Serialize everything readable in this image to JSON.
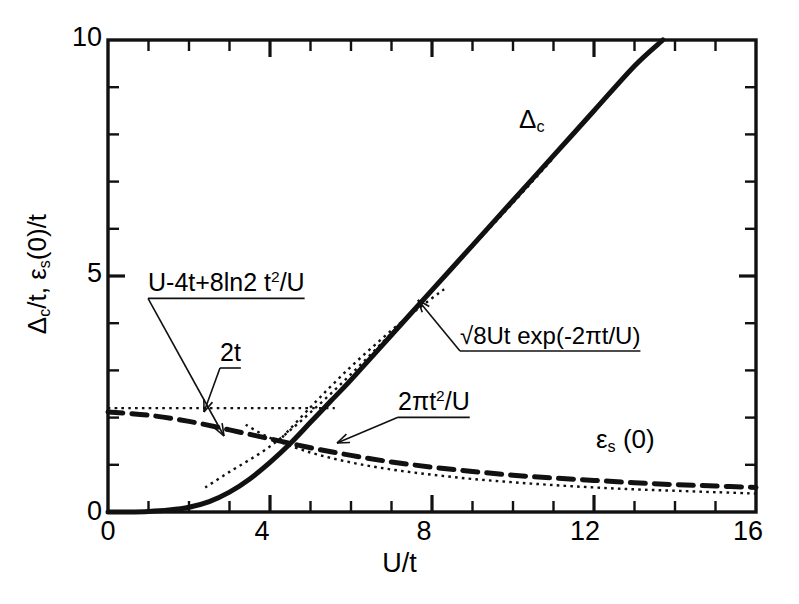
{
  "page": {
    "header_faint": "",
    "page_number": ""
  },
  "chart_data": {
    "type": "line",
    "title": "",
    "xlabel": "U/t",
    "ylabel": "Δc/t, εs(0)/t",
    "xlim": [
      0,
      16
    ],
    "ylim": [
      0,
      10
    ],
    "grid": false,
    "legend": "inline-annotations",
    "x_ticks_major": [
      0,
      4,
      8,
      12,
      16
    ],
    "x_ticks_major_labels": [
      "0",
      "4",
      "8",
      "12",
      "16"
    ],
    "x_tick_minor_step": 1,
    "y_ticks_major": [
      0,
      5,
      10
    ],
    "y_ticks_major_labels": [
      "0",
      "5",
      "10"
    ],
    "y_tick_minor_step": 1,
    "series": [
      {
        "name": "Δc",
        "style": "solid",
        "label": "Δc",
        "x": [
          0,
          0.5,
          1,
          1.5,
          2,
          2.5,
          3,
          3.5,
          4,
          4.5,
          5,
          5.5,
          6,
          7,
          8,
          9,
          10,
          11,
          12,
          13,
          13.7
        ],
        "y": [
          0,
          0.0,
          0.01,
          0.04,
          0.1,
          0.22,
          0.42,
          0.7,
          1.05,
          1.45,
          1.9,
          2.35,
          2.8,
          3.75,
          4.7,
          5.65,
          6.6,
          7.55,
          8.5,
          9.45,
          10.0
        ]
      },
      {
        "name": "εs(0)",
        "style": "dashed",
        "label": "εs (0)",
        "x": [
          0,
          1,
          2,
          3,
          4,
          5,
          6,
          7,
          8,
          9,
          10,
          11,
          12,
          13,
          14,
          15,
          16
        ],
        "y": [
          2.12,
          2.05,
          1.92,
          1.74,
          1.55,
          1.36,
          1.2,
          1.06,
          0.95,
          0.86,
          0.78,
          0.72,
          0.67,
          0.62,
          0.58,
          0.55,
          0.52
        ]
      },
      {
        "name": "2t",
        "style": "dotted",
        "label": "2t",
        "x": [
          0,
          5.6
        ],
        "y": [
          2.2,
          2.2
        ]
      },
      {
        "name": "U-4t+8ln2 t^2/U",
        "style": "dotted",
        "label": "U-4t+8ln2 t2/U",
        "x": [
          2.4,
          3,
          4,
          5,
          6,
          7,
          8,
          9,
          10,
          11
        ],
        "y": [
          0.52,
          0.85,
          1.39,
          2.11,
          2.92,
          3.79,
          4.69,
          5.62,
          6.55,
          7.5
        ]
      },
      {
        "name": "2πt^2/U",
        "style": "dotted",
        "label": "2πt2/U",
        "x": [
          3.4,
          4,
          5,
          6,
          7,
          8,
          9,
          10,
          11,
          12,
          13,
          14,
          15,
          16
        ],
        "y": [
          1.85,
          1.57,
          1.26,
          1.05,
          0.9,
          0.79,
          0.7,
          0.63,
          0.57,
          0.52,
          0.48,
          0.45,
          0.42,
          0.39
        ]
      },
      {
        "name": "sqrt(8Ut) exp(-2πt/U)",
        "style": "dotted",
        "label": "√8Ut exp(-2πt/U)",
        "x": [
          4.3,
          5,
          5.5,
          6,
          6.5,
          7,
          7.5,
          8,
          8.3
        ],
        "y": [
          1.58,
          2.22,
          2.66,
          3.08,
          3.47,
          3.85,
          4.2,
          4.53,
          4.72
        ]
      }
    ],
    "annotations": [
      {
        "id": "ann-u4t",
        "text": "U-4t+8ln2 t2/U",
        "html": "U-4t+8ln2 t<sup>2</sup>/U",
        "x_px": 148,
        "y_px": 268,
        "has_leader": true,
        "leader_to_px": [
          224,
          436
        ]
      },
      {
        "id": "ann-2t",
        "text": "2t",
        "html": "2t",
        "x_px": 220,
        "y_px": 338,
        "has_leader": true,
        "leader_to_px": [
          204,
          412
        ]
      },
      {
        "id": "ann-2pit2u",
        "text": "2πt2/U",
        "html": "2&#960;t<sup>2</sup>/U",
        "x_px": 398,
        "y_px": 387,
        "has_leader": true,
        "leader_to_px": [
          337,
          443
        ]
      },
      {
        "id": "ann-sqrt8ut",
        "text": "√8Ut exp(-2πt/U)",
        "html": "&#8730;8Ut exp(-2&#960;t/U)",
        "x_px": 460,
        "y_px": 322,
        "has_leader": true,
        "leader_to_px": [
          418,
          300
        ]
      },
      {
        "id": "ann-delta-c",
        "text": "Δc",
        "html": "&#916;<span class=\"sub\">c</span>",
        "x_px": 519,
        "y_px": 104,
        "has_leader": false
      },
      {
        "id": "ann-eps-s",
        "text": "εs (0)",
        "html": "&#949;<span class=\"sub\">s</span> (0)",
        "x_px": 596,
        "y_px": 424,
        "has_leader": false
      }
    ]
  },
  "axis_titles": {
    "x": "U/t",
    "y_delta": "Δ",
    "y_delta_sub": "c",
    "y_mid": "/t,  ",
    "y_eps": "ε",
    "y_eps_sub": "s",
    "y_tail": "(0)/t"
  },
  "tick_labels": {
    "x": [
      "0",
      "4",
      "8",
      "12",
      "16"
    ],
    "y": [
      "0",
      "5",
      "10"
    ]
  },
  "colors": {
    "ink": "#111111",
    "background": "#ffffff",
    "faint_header": "#c9c9cf"
  }
}
